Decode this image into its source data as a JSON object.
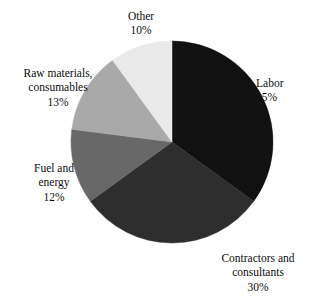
{
  "chart_data": {
    "type": "pie",
    "title": "",
    "subtitle": "",
    "xlabel": "",
    "ylabel": "",
    "legend_position": "none",
    "grid": false,
    "unit": "%",
    "start_angle_deg": 0,
    "direction": "clockwise",
    "categories": [
      "Labor",
      "Contractors and consultants",
      "Fuel and energy",
      "Raw materials, consumables",
      "Other"
    ],
    "values": [
      35,
      30,
      12,
      13,
      10
    ],
    "colors": [
      "#111111",
      "#2e2e2e",
      "#686868",
      "#a9a9a9",
      "#e9e9e9"
    ],
    "slices": [
      {
        "name": "Labor",
        "value": 35,
        "value_label": "35%",
        "color": "#111111",
        "label_lines": [
          "Labor"
        ],
        "start_deg": 0,
        "end_deg": 126
      },
      {
        "name": "Contractors and consultants",
        "value": 30,
        "value_label": "30%",
        "color": "#2e2e2e",
        "label_lines": [
          "Contractors and",
          "consultants"
        ],
        "start_deg": 126,
        "end_deg": 234
      },
      {
        "name": "Fuel and energy",
        "value": 12,
        "value_label": "12%",
        "color": "#686868",
        "label_lines": [
          "Fuel and",
          "energy"
        ],
        "start_deg": 234,
        "end_deg": 277.2
      },
      {
        "name": "Raw materials, consumables",
        "value": 13,
        "value_label": "13%",
        "color": "#a9a9a9",
        "label_lines": [
          "Raw materials,",
          "consumables"
        ],
        "start_deg": 277.2,
        "end_deg": 324
      },
      {
        "name": "Other",
        "value": 10,
        "value_label": "10%",
        "color": "#e9e9e9",
        "label_lines": [
          "Other"
        ],
        "start_deg": 324,
        "end_deg": 360
      }
    ],
    "geometry": {
      "center_x": 172,
      "center_y": 142,
      "radius": 101
    }
  }
}
